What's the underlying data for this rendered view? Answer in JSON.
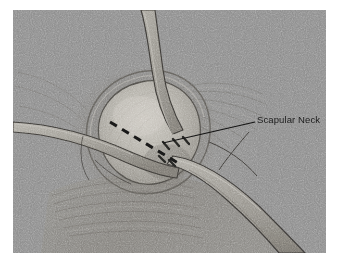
{
  "figure": {
    "kind": "surgical-anatomical-illustration",
    "style": "grayscale halftone line drawing with film grain",
    "background_color": "#ffffff",
    "plate_color": "#8b8b8b",
    "plate": {
      "x": 13,
      "y": 10,
      "width": 313,
      "height": 243
    }
  },
  "annotations": [
    {
      "id": "scapular-neck",
      "label": "Scapular Neck",
      "text_color": "#1c1c1c",
      "leader_color": "#141414",
      "leader_from": {
        "x": 255,
        "y": 122
      },
      "leader_to": {
        "x": 163,
        "y": 143
      }
    }
  ],
  "markings": {
    "osteotomy_line": {
      "name": "dashed osteotomy line",
      "style": "dashed",
      "color": "#171717",
      "from": {
        "x": 110,
        "y": 122
      },
      "to": {
        "x": 178,
        "y": 163
      }
    }
  },
  "anatomy": [
    {
      "id": "glenoid-face",
      "label": "glenoid articular surface",
      "tone": "#b6b3ab"
    },
    {
      "id": "capsule-rim",
      "label": "capsular rim",
      "tone": "#6f6c66"
    },
    {
      "id": "muscle-fibers-lower",
      "label": "striated muscle fibers",
      "tone": "#85847f"
    },
    {
      "id": "muscle-fibers-upper-right",
      "label": "radiating fiber strands",
      "tone": "#8a8884"
    }
  ],
  "instruments": [
    {
      "id": "retractor-superior",
      "label": "superior retractor blade",
      "tone": "#9b9890"
    },
    {
      "id": "retractor-left",
      "label": "curved left retractor",
      "tone": "#97948c"
    },
    {
      "id": "retractor-inferior-right",
      "label": "inferior right retractor blade",
      "tone": "#a09d95"
    },
    {
      "id": "retractor-teeth",
      "label": "retractor teeth",
      "tone": "#2a2a2a"
    }
  ]
}
